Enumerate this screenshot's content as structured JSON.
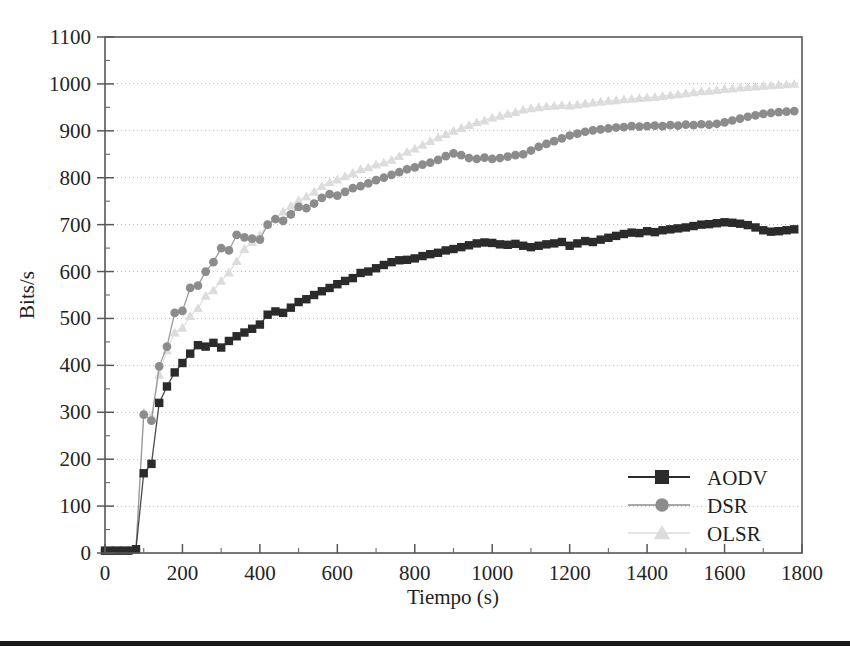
{
  "chart_data": {
    "type": "line",
    "title": "",
    "subtitle": "",
    "xlabel": "Tiempo (s)",
    "ylabel": "Bits/s",
    "xlim": [
      0,
      1800
    ],
    "ylim": [
      0,
      1100
    ],
    "x_ticks": [
      0,
      200,
      400,
      600,
      800,
      1000,
      1200,
      1400,
      1600,
      1800
    ],
    "y_ticks": [
      0,
      100,
      200,
      300,
      400,
      500,
      600,
      700,
      800,
      900,
      1000,
      1100
    ],
    "x_minor_step": 100,
    "y_minor_step": 50,
    "grid": true,
    "grid_axis": "y",
    "legend_position": "bottom-right",
    "x": [
      0,
      20,
      40,
      60,
      80,
      100,
      120,
      140,
      160,
      180,
      200,
      220,
      240,
      260,
      280,
      300,
      320,
      340,
      360,
      380,
      400,
      420,
      440,
      460,
      480,
      500,
      520,
      540,
      560,
      580,
      600,
      620,
      640,
      660,
      680,
      700,
      720,
      740,
      760,
      780,
      800,
      820,
      840,
      860,
      880,
      900,
      920,
      940,
      960,
      980,
      1000,
      1020,
      1040,
      1060,
      1080,
      1100,
      1120,
      1140,
      1160,
      1180,
      1200,
      1220,
      1240,
      1260,
      1280,
      1300,
      1320,
      1340,
      1360,
      1380,
      1400,
      1420,
      1440,
      1460,
      1480,
      1500,
      1520,
      1540,
      1560,
      1580,
      1600,
      1620,
      1640,
      1660,
      1680,
      1700,
      1720,
      1740,
      1760,
      1780
    ],
    "series": [
      {
        "name": "AODV",
        "color": "#2b2b2b",
        "marker": "square",
        "values": [
          5,
          5,
          5,
          5,
          8,
          170,
          190,
          320,
          355,
          385,
          405,
          425,
          443,
          440,
          448,
          438,
          452,
          462,
          470,
          478,
          487,
          508,
          515,
          512,
          523,
          535,
          541,
          550,
          558,
          565,
          573,
          580,
          586,
          597,
          600,
          607,
          614,
          620,
          624,
          625,
          628,
          633,
          637,
          640,
          645,
          648,
          652,
          656,
          660,
          662,
          661,
          658,
          657,
          659,
          655,
          652,
          655,
          658,
          660,
          663,
          655,
          660,
          665,
          663,
          668,
          672,
          676,
          680,
          683,
          682,
          686,
          684,
          688,
          690,
          692,
          694,
          697,
          700,
          701,
          703,
          705,
          704,
          702,
          699,
          694,
          688,
          685,
          686,
          688,
          690
        ]
      },
      {
        "name": "DSR",
        "color": "#8c8c8c",
        "marker": "circle",
        "values": [
          5,
          5,
          5,
          5,
          8,
          295,
          282,
          398,
          440,
          512,
          516,
          565,
          570,
          600,
          620,
          650,
          645,
          678,
          673,
          670,
          668,
          700,
          712,
          708,
          722,
          738,
          735,
          745,
          757,
          765,
          762,
          770,
          778,
          782,
          788,
          795,
          800,
          806,
          812,
          818,
          822,
          828,
          832,
          838,
          846,
          852,
          848,
          842,
          840,
          843,
          840,
          842,
          845,
          848,
          850,
          858,
          866,
          872,
          878,
          884,
          890,
          894,
          898,
          901,
          903,
          905,
          907,
          908,
          910,
          909,
          910,
          911,
          910,
          912,
          911,
          913,
          912,
          914,
          913,
          915,
          918,
          922,
          926,
          930,
          933,
          936,
          938,
          940,
          941,
          942
        ]
      },
      {
        "name": "OLSR",
        "color": "#dcdcdc",
        "marker": "triangle",
        "values": [
          5,
          5,
          5,
          5,
          8,
          300,
          292,
          380,
          432,
          470,
          480,
          505,
          522,
          548,
          560,
          580,
          598,
          622,
          648,
          663,
          678,
          700,
          712,
          728,
          740,
          752,
          760,
          770,
          782,
          790,
          796,
          803,
          810,
          818,
          822,
          828,
          832,
          838,
          846,
          855,
          862,
          870,
          878,
          886,
          893,
          900,
          906,
          912,
          918,
          922,
          928,
          932,
          936,
          940,
          945,
          948,
          950,
          952,
          953,
          955,
          954,
          956,
          958,
          960,
          962,
          964,
          965,
          967,
          968,
          970,
          971,
          972,
          974,
          976,
          978,
          980,
          982,
          984,
          985,
          987,
          989,
          990,
          992,
          993,
          994,
          996,
          997,
          998,
          999,
          1000
        ]
      }
    ]
  },
  "legend": {
    "items": [
      {
        "label": "AODV",
        "marker": "square",
        "color": "#2b2b2b"
      },
      {
        "label": "DSR",
        "marker": "circle",
        "color": "#8c8c8c"
      },
      {
        "label": "OLSR",
        "marker": "triangle",
        "color": "#dcdcdc"
      }
    ]
  },
  "axes": {
    "x_title": "Tiempo (s)",
    "y_title": "Bits/s",
    "x_tick_labels": [
      "0",
      "200",
      "400",
      "600",
      "800",
      "1000",
      "1200",
      "1400",
      "1600",
      "1800"
    ],
    "y_tick_labels": [
      "0",
      "100",
      "200",
      "300",
      "400",
      "500",
      "600",
      "700",
      "800",
      "900",
      "1000",
      "1100"
    ]
  },
  "style": {
    "frame_color": "#585858",
    "grid_color": "#b8b8b8",
    "background": "#ffffff",
    "rule_color": "#1b1b1b"
  }
}
